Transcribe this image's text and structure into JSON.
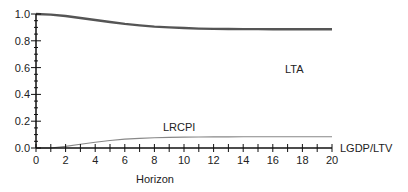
{
  "chart_data": {
    "type": "line",
    "title": "",
    "xlabel": "Horizon",
    "ylabel": "",
    "xlim": [
      0,
      20
    ],
    "ylim": [
      0,
      1.0
    ],
    "grid": false,
    "legend_position": "inline labels",
    "x_ticks": [
      "0",
      "2",
      "4",
      "6",
      "8",
      "10",
      "12",
      "14",
      "16",
      "18",
      "20"
    ],
    "y_ticks": [
      "0.0",
      "0.2",
      "0.4",
      "0.6",
      "0.8",
      "1.0"
    ],
    "x": [
      0,
      1,
      2,
      3,
      4,
      5,
      6,
      7,
      8,
      9,
      10,
      11,
      12,
      13,
      14,
      15,
      16,
      17,
      18,
      19,
      20
    ],
    "series": [
      {
        "name": "LTA",
        "color": "#555555",
        "values": [
          1.0,
          0.995,
          0.985,
          0.97,
          0.955,
          0.94,
          0.926,
          0.915,
          0.906,
          0.9,
          0.895,
          0.891,
          0.889,
          0.888,
          0.887,
          0.887,
          0.886,
          0.886,
          0.886,
          0.886,
          0.886
        ]
      },
      {
        "name": "LRCPI",
        "color": "#888888",
        "values": [
          0.0,
          0.0,
          0.012,
          0.028,
          0.043,
          0.056,
          0.066,
          0.072,
          0.076,
          0.079,
          0.081,
          0.082,
          0.083,
          0.083,
          0.084,
          0.084,
          0.084,
          0.084,
          0.084,
          0.084,
          0.084
        ]
      },
      {
        "name": "LGDP/LTV",
        "color": "#888888",
        "values": [
          0,
          0,
          0,
          0,
          0,
          0,
          0,
          0,
          0,
          0,
          0,
          0,
          0,
          0,
          0,
          0,
          0,
          0,
          0,
          0,
          0
        ]
      }
    ],
    "labels": {
      "lta": "LTA",
      "lrcpi": "LRCPI",
      "lgdp": "LGDP/LTV"
    }
  }
}
